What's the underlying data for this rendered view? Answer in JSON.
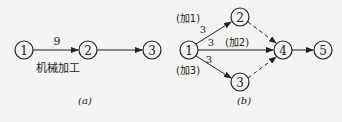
{
  "diagram_a": {
    "nodes": [
      {
        "id": "1",
        "label": "1"
      },
      {
        "id": "2",
        "label": "2"
      },
      {
        "id": "3",
        "label": "3"
      }
    ],
    "edge_label": "9",
    "task_label": "机械加工",
    "caption": "(a)"
  },
  "diagram_b": {
    "nodes": [
      {
        "label": "1"
      },
      {
        "label": "2"
      },
      {
        "label": "3"
      },
      {
        "label": "4"
      },
      {
        "label": "5"
      }
    ],
    "edges": [
      {
        "from": "1",
        "to": "2",
        "duration": "3",
        "name": "(加1)",
        "style": "solid"
      },
      {
        "from": "1",
        "to": "4",
        "duration": "3",
        "name": "(加2)",
        "style": "solid"
      },
      {
        "from": "1",
        "to": "3",
        "duration": "3",
        "name": "(加3)",
        "style": "solid"
      },
      {
        "from": "2",
        "to": "4",
        "style": "dashed"
      },
      {
        "from": "3",
        "to": "4",
        "style": "dashed"
      },
      {
        "from": "4",
        "to": "5",
        "style": "solid"
      }
    ],
    "caption": "(b)"
  }
}
